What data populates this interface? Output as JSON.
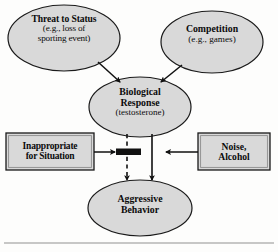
{
  "figure": {
    "type": "flow-diagram",
    "background_color": "#fdfdfc",
    "node_fill_color": "#d9d9d9",
    "node_stroke_color": "#1a1a1a",
    "connector_color": "#111111",
    "rule_color": "#b4b4b4"
  },
  "nodes": {
    "threat": {
      "shape": "ellipse",
      "line1": "Threat to Status",
      "line2": "(e.g., loss of",
      "line3": "sporting event)"
    },
    "competition": {
      "shape": "ellipse",
      "line1": "Competition",
      "line2": "(e.g., games)"
    },
    "biological": {
      "shape": "ellipse",
      "line1": "Biological",
      "line2": "Response",
      "line3": "(testosterone)"
    },
    "inappropriate": {
      "shape": "rectangle",
      "line1": "Inappropriate",
      "line2": "for Situation"
    },
    "noise": {
      "shape": "rectangle",
      "line1": "Noise,",
      "line2": "Alcohol"
    },
    "aggressive": {
      "shape": "ellipse",
      "line1": "Aggressive",
      "line2": "Behavior"
    }
  },
  "connectors": [
    {
      "name": "threat-to-biological",
      "from": "threat",
      "to": "biological",
      "style": "solid",
      "arrow": "end"
    },
    {
      "name": "competition-to-biological",
      "from": "competition",
      "to": "biological",
      "style": "solid",
      "arrow": "end"
    },
    {
      "name": "biological-to-aggressive-dashed",
      "from": "biological",
      "to": "aggressive",
      "style": "dashed",
      "arrow": "end"
    },
    {
      "name": "biological-to-aggressive-solid",
      "from": "biological",
      "to": "aggressive",
      "style": "solid",
      "arrow": "end"
    },
    {
      "name": "inappropriate-to-gate",
      "from": "inappropriate",
      "to": "gate",
      "style": "solid",
      "arrow": "end"
    },
    {
      "name": "noise-to-gate",
      "from": "noise",
      "to": "gate",
      "style": "solid",
      "arrow": "end"
    }
  ],
  "gate": {
    "name": "moderator-bar",
    "description": "solid black horizontal bar interrupting the dashed path"
  }
}
